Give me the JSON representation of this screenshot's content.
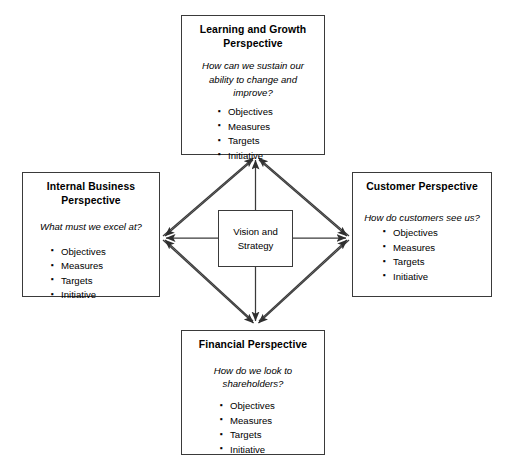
{
  "diagram": {
    "center": {
      "label": "Vision and\nStrategy",
      "line1": "Vision and",
      "line2": "Strategy"
    },
    "nodes": [
      {
        "id": "learning",
        "title": "Learning and Growth Perspective",
        "question": "How can we sustain our ability to change and improve?",
        "items": [
          "Objectives",
          "Measures",
          "Targets",
          "Initiative"
        ]
      },
      {
        "id": "internal",
        "title": "Internal Business Perspective",
        "question": "What must we excel at?",
        "items": [
          "Objectives",
          "Measures",
          "Targets",
          "Initiative"
        ]
      },
      {
        "id": "customer",
        "title": "Customer Perspective",
        "question": "How do customers see us?",
        "items": [
          "Objectives",
          "Measures",
          "Targets",
          "Initiative"
        ]
      },
      {
        "id": "financial",
        "title": "Financial Perspective",
        "question": "How do we look to shareholders?",
        "items": [
          "Objectives",
          "Measures",
          "Targets",
          "Initiative"
        ]
      }
    ],
    "colors": {
      "border": "#3a3a3a",
      "line": "#3a3a3a",
      "text": "#000000",
      "background": "#ffffff"
    }
  }
}
